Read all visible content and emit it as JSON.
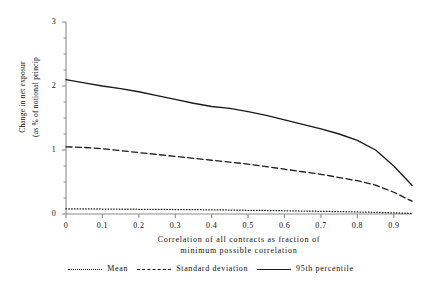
{
  "chart_data": {
    "type": "line",
    "title": "",
    "xlabel": "Correlation of all contracts as fraction of minimum possible correlation",
    "xlabel_line1": "Correlation of all contracts as fraction of",
    "xlabel_line2": "minimum possible correlation",
    "ylabel": "Change in net exposur (as % of notional princip",
    "ylabel_line1": "Change in net exposur",
    "ylabel_line2": "(as % of notional princip",
    "xlim": [
      0,
      0.95
    ],
    "ylim": [
      0,
      3
    ],
    "grid": false,
    "legend_position": "bottom",
    "xticks": [
      "0",
      "0.1",
      "0.2",
      "0.3",
      "0.4",
      "0.5",
      "0.6",
      "0.7",
      "0.8",
      "0.9"
    ],
    "xtick_values": [
      0,
      0.1,
      0.2,
      0.3,
      0.4,
      0.5,
      0.6,
      0.7,
      0.8,
      0.9
    ],
    "yticks": [
      "0",
      "1",
      "2",
      "3"
    ],
    "ytick_values": [
      0,
      1,
      2,
      3
    ],
    "yminor_values": [
      0.25,
      0.5,
      0.75,
      1.25,
      1.5,
      1.75,
      2.25,
      2.5,
      2.75
    ],
    "x": [
      0,
      0.05,
      0.1,
      0.15,
      0.2,
      0.25,
      0.3,
      0.35,
      0.4,
      0.45,
      0.5,
      0.55,
      0.6,
      0.65,
      0.7,
      0.75,
      0.8,
      0.85,
      0.9,
      0.95
    ],
    "series": [
      {
        "name": "Mean",
        "style": "dotted",
        "color": "#1a1a1a",
        "values": [
          0.08,
          0.08,
          0.078,
          0.076,
          0.074,
          0.072,
          0.07,
          0.068,
          0.065,
          0.062,
          0.058,
          0.055,
          0.05,
          0.046,
          0.042,
          0.037,
          0.032,
          0.026,
          0.018,
          0.01
        ]
      },
      {
        "name": "Standard deviation",
        "style": "dashed",
        "color": "#1a1a1a",
        "values": [
          1.05,
          1.04,
          1.02,
          0.99,
          0.96,
          0.93,
          0.9,
          0.87,
          0.84,
          0.81,
          0.78,
          0.74,
          0.7,
          0.66,
          0.62,
          0.57,
          0.52,
          0.45,
          0.34,
          0.2
        ]
      },
      {
        "name": "95th percentile",
        "style": "solid",
        "color": "#1a1a1a",
        "values": [
          2.1,
          2.05,
          2.0,
          1.96,
          1.91,
          1.85,
          1.79,
          1.73,
          1.68,
          1.65,
          1.6,
          1.54,
          1.47,
          1.4,
          1.33,
          1.25,
          1.15,
          1.0,
          0.75,
          0.45
        ]
      }
    ]
  },
  "axes": {
    "yticks": [
      {
        "label": "3",
        "value": 3
      },
      {
        "label": "2",
        "value": 2
      },
      {
        "label": "1",
        "value": 1
      },
      {
        "label": "0",
        "value": 0
      }
    ],
    "xticks": [
      {
        "label": "0",
        "value": 0
      },
      {
        "label": "0.1",
        "value": 0.1
      },
      {
        "label": "0.2",
        "value": 0.2
      },
      {
        "label": "0.3",
        "value": 0.3
      },
      {
        "label": "0.4",
        "value": 0.4
      },
      {
        "label": "0.5",
        "value": 0.5
      },
      {
        "label": "0.6",
        "value": 0.6
      },
      {
        "label": "0.7",
        "value": 0.7
      },
      {
        "label": "0.8",
        "value": 0.8
      },
      {
        "label": "0.9",
        "value": 0.9
      }
    ]
  },
  "legend": {
    "entries": [
      {
        "label": "Mean",
        "style": "dotted"
      },
      {
        "label": "Standard deviation",
        "style": "dashed"
      },
      {
        "label": "95th percentile",
        "style": "solid"
      }
    ]
  },
  "colors": {
    "ink": "#1a1a1a",
    "axis": "#8c8c8c",
    "background": "#ffffff"
  }
}
